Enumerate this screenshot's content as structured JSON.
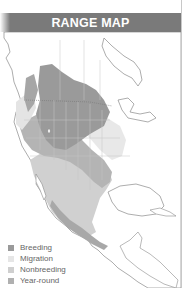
{
  "header": {
    "title": "RANGE MAP",
    "color": "#7a7a7a"
  },
  "map": {
    "region": "North America",
    "colors": {
      "breeding": "#9a9a9a",
      "migration": "#e6e6e6",
      "nonbreeding": "#d0d0d0",
      "year_round": "#b0b0b0",
      "land": "#ffffff",
      "outline": "#8a8a8a",
      "border": "#c4c4c4"
    }
  },
  "legend": {
    "items": [
      {
        "label": "Breeding",
        "color": "#9a9a9a"
      },
      {
        "label": "Migration",
        "color": "#e6e6e6"
      },
      {
        "label": "Nonbreeding",
        "color": "#cfcfcf"
      },
      {
        "label": "Year-round",
        "color": "#b0b0b0"
      }
    ]
  }
}
